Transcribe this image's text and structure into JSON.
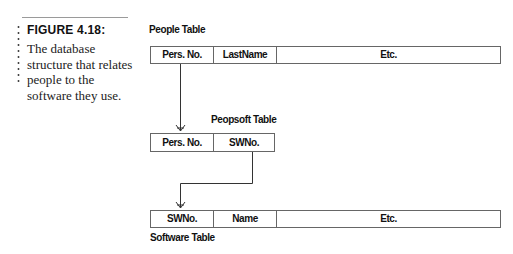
{
  "caption": {
    "figure_label": "FIGURE 4.18:",
    "text": "The database structure that relates people to the software they use."
  },
  "tables": {
    "people": {
      "title": "People Table",
      "columns": [
        "Pers. No.",
        "LastName",
        "Etc."
      ]
    },
    "peopsoft": {
      "title": "Peopsoft Table",
      "columns": [
        "Pers. No.",
        "SWNo."
      ]
    },
    "software": {
      "title": "Software Table",
      "columns": [
        "SWNo.",
        "Name",
        "Etc."
      ]
    }
  },
  "relations": [
    {
      "from": "People Table.Pers. No.",
      "to": "Peopsoft Table.Pers. No."
    },
    {
      "from": "Peopsoft Table.SWNo.",
      "to": "Software Table.SWNo."
    }
  ]
}
